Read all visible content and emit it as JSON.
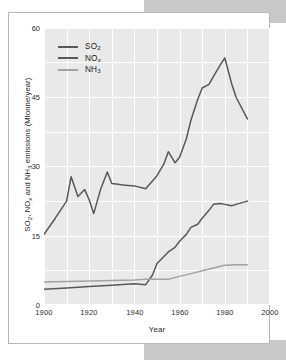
{
  "figure": {
    "background_color": "#ffffff",
    "plot_background_color": "#e9e9e9",
    "grid_color": "#ffffff",
    "page_edge_color": "#c9c9c9"
  },
  "chart_data": {
    "type": "line",
    "title": "",
    "subtitle": "",
    "xlabel": "Year",
    "ylabel": "SO₂, NOₓ, and NH₃ emissions (Mtonne/year)",
    "xlim": [
      1900,
      2000
    ],
    "ylim": [
      0,
      60
    ],
    "xticks": [
      1900,
      1920,
      1940,
      1960,
      1980,
      2000
    ],
    "xtick_labels": [
      "1900",
      "1920",
      "1940",
      "1960",
      "1980",
      "2000"
    ],
    "yticks": [
      0,
      15,
      30,
      45,
      60
    ],
    "ytick_labels": [
      "0",
      "15",
      "30",
      "45",
      "60"
    ],
    "grid": true,
    "legend_position": "upper left",
    "series": [
      {
        "name": "SO₂",
        "color": "#585858",
        "x": [
          1900,
          1905,
          1910,
          1912,
          1915,
          1918,
          1920,
          1922,
          1925,
          1928,
          1930,
          1932,
          1935,
          1940,
          1945,
          1950,
          1953,
          1955,
          1958,
          1960,
          1963,
          1965,
          1968,
          1970,
          1973,
          1975,
          1978,
          1980,
          1983,
          1985,
          1990
        ],
        "y": [
          15.3,
          18.8,
          22.5,
          27.8,
          23.5,
          25.0,
          22.8,
          19.8,
          25.0,
          28.8,
          26.3,
          26.2,
          26.0,
          25.8,
          25.2,
          28.0,
          30.5,
          33.2,
          30.8,
          32.0,
          36.0,
          40.0,
          44.5,
          47.0,
          47.8,
          49.5,
          52.0,
          53.5,
          48.0,
          45.0,
          40.3
        ]
      },
      {
        "name": "NOₓ",
        "color": "#585858",
        "x": [
          1900,
          1910,
          1920,
          1930,
          1940,
          1945,
          1948,
          1950,
          1955,
          1958,
          1960,
          1963,
          1965,
          1968,
          1970,
          1973,
          1975,
          1978,
          1980,
          1983,
          1985,
          1990
        ],
        "y": [
          3.4,
          3.7,
          4.0,
          4.3,
          4.6,
          4.4,
          6.5,
          9.0,
          11.5,
          12.5,
          13.8,
          15.3,
          16.8,
          17.5,
          18.8,
          20.5,
          21.8,
          22.0,
          21.8,
          21.5,
          21.8,
          22.5
        ]
      },
      {
        "name": "NH₃",
        "color": "#a2a2a2",
        "x": [
          1900,
          1920,
          1940,
          1945,
          1950,
          1955,
          1960,
          1965,
          1970,
          1975,
          1980,
          1985,
          1990
        ],
        "y": [
          5.0,
          5.2,
          5.4,
          5.6,
          5.6,
          5.6,
          6.2,
          6.8,
          7.4,
          8.0,
          8.6,
          8.7,
          8.7
        ]
      }
    ]
  },
  "legend": {
    "entries": [
      {
        "label_html": "SO<sub>2</sub>",
        "color": "#585858"
      },
      {
        "label_html": "NO<span class=\"subx\">x</span>",
        "color": "#585858"
      },
      {
        "label_html": "NH<sub>3</sub>",
        "color": "#a2a2a2"
      }
    ]
  },
  "axes": {
    "y_title": "SO₂, NOₓ and NH₃ emissions (Mtonne/year)",
    "x_title": "Year",
    "y_tick_labels": [
      "60",
      "45",
      "30",
      "15",
      "0"
    ],
    "x_tick_labels": [
      "1900",
      "1920",
      "1940",
      "1960",
      "1980",
      "2000"
    ]
  }
}
